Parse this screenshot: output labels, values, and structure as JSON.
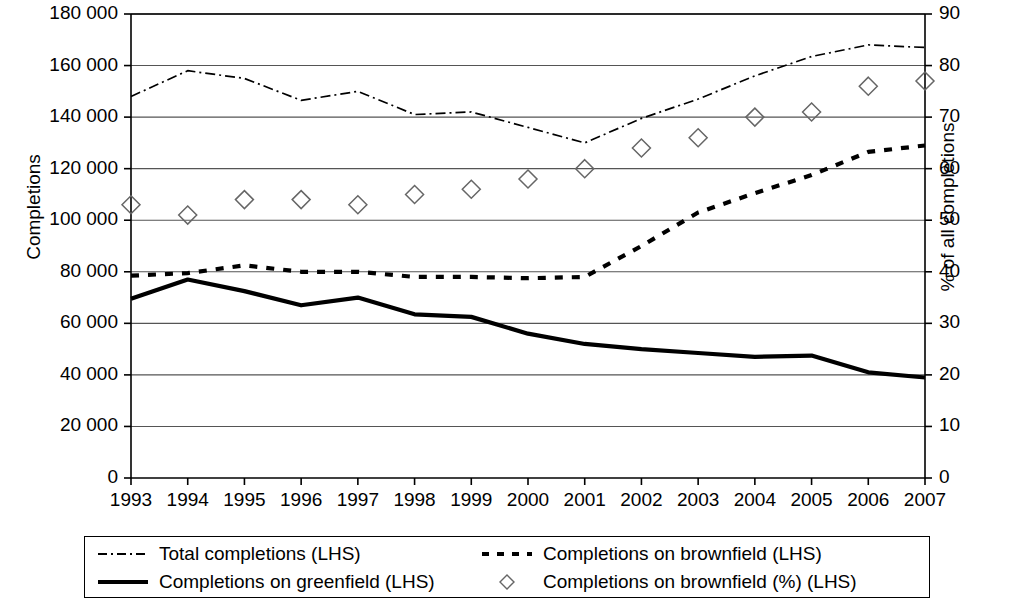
{
  "chart_data": {
    "type": "line",
    "title": "",
    "xlabel": "",
    "ylabel": "Completions",
    "ylabel_secondary": "% of all completions",
    "x": [
      1993,
      1994,
      1995,
      1996,
      1997,
      1998,
      1999,
      2000,
      2001,
      2002,
      2003,
      2004,
      2005,
      2006,
      2007
    ],
    "xticklabels": [
      "1993",
      "1994",
      "1995",
      "1996",
      "1997",
      "1998",
      "1999",
      "2000",
      "2001",
      "2002",
      "2003",
      "2004",
      "2005",
      "2006",
      "2007"
    ],
    "ylim": [
      0,
      180000
    ],
    "yticks": [
      0,
      20000,
      40000,
      60000,
      80000,
      100000,
      120000,
      140000,
      160000,
      180000
    ],
    "yticklabels": [
      "0",
      "20 000",
      "40 000",
      "60 000",
      "80 000",
      "100 000",
      "120 000",
      "140 000",
      "160 000",
      "180 000"
    ],
    "ylim_secondary": [
      0,
      90
    ],
    "yticks_secondary": [
      0,
      10,
      20,
      30,
      40,
      50,
      60,
      70,
      80,
      90
    ],
    "yticklabels_secondary": [
      "0",
      "10",
      "20",
      "30",
      "40",
      "50",
      "60",
      "70",
      "80",
      "90"
    ],
    "grid": "horizontal",
    "legend_position": "bottom",
    "series": [
      {
        "name": "Total completions (LHS)",
        "style": "dash-dot",
        "axis": "left",
        "color": "#000000",
        "values": [
          148000,
          158000,
          155000,
          146500,
          150000,
          141000,
          142000,
          136000,
          130000,
          139500,
          147000,
          156000,
          163500,
          168000,
          167000
        ]
      },
      {
        "name": "Completions on brownfield (LHS)",
        "style": "dashed",
        "axis": "left",
        "color": "#000000",
        "values": [
          78500,
          79500,
          82500,
          80000,
          80000,
          78000,
          78000,
          77500,
          78000,
          90000,
          103000,
          110500,
          117500,
          126500,
          129000
        ]
      },
      {
        "name": "Completions on greenfield (LHS)",
        "style": "solid",
        "axis": "left",
        "color": "#000000",
        "values": [
          69500,
          77000,
          72500,
          67000,
          70000,
          63500,
          62500,
          56000,
          52000,
          50000,
          48500,
          47000,
          47500,
          41000,
          39000
        ]
      },
      {
        "name": "Completions on brownfield (%) (LHS)",
        "style": "diamond-markers",
        "axis": "right",
        "color": "#666666",
        "values": [
          53,
          51,
          54,
          54,
          53,
          55,
          56,
          58,
          60,
          64,
          66,
          70,
          71,
          76,
          77
        ]
      }
    ]
  },
  "legend": {
    "items": [
      {
        "label": "Total completions (LHS)",
        "key": "dash-dot-line-key"
      },
      {
        "label": "Completions on brownfield (LHS)",
        "key": "dashed-line-key"
      },
      {
        "label": "Completions on greenfield (LHS)",
        "key": "solid-line-key"
      },
      {
        "label": "Completions on brownfield (%) (LHS)",
        "key": "diamond-marker-key"
      }
    ]
  },
  "colors": {
    "axis": "#000000",
    "grid": "#555555",
    "marker": "#666666"
  }
}
